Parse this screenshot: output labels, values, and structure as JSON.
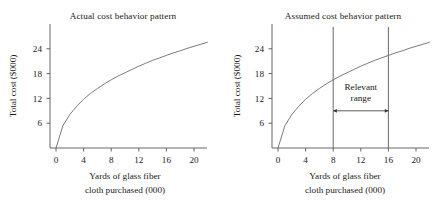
{
  "figure": {
    "background": "#ffffff",
    "ink": "#1a1a1a",
    "axis_color": "#555555",
    "curve_color": "#6b6b6b"
  },
  "chart_data": [
    {
      "type": "line",
      "panel": "left",
      "title": "Actual cost behavior pattern",
      "xlabel_line1": "Yards of glass fiber",
      "xlabel_line2": "cloth purchased (000)",
      "ylabel": "Total cost ($000)",
      "xlim": [
        0,
        22
      ],
      "ylim": [
        0,
        30
      ],
      "xticks": [
        0,
        4,
        8,
        12,
        16,
        20
      ],
      "xticklabels": [
        "0",
        "4",
        "8",
        "12",
        "16",
        "20"
      ],
      "yticks": [
        6,
        12,
        18,
        24
      ],
      "yticklabels": [
        "6",
        "12",
        "18",
        "24"
      ],
      "grid": false,
      "legend": "none",
      "series": [
        {
          "name": "Actual cost curve",
          "shape": "concave-increasing",
          "x": [
            0,
            1,
            2,
            3,
            4,
            5,
            6,
            7,
            8,
            9,
            10,
            11,
            12,
            13,
            14,
            15,
            16,
            17,
            18,
            19,
            20,
            21,
            22
          ],
          "y": [
            0.0,
            5.4,
            8.1,
            10.1,
            11.8,
            13.2,
            14.4,
            15.5,
            16.5,
            17.4,
            18.2,
            19.0,
            19.8,
            20.5,
            21.2,
            21.8,
            22.4,
            23.0,
            23.5,
            24.1,
            24.6,
            25.1,
            25.6
          ]
        }
      ],
      "annotations": []
    },
    {
      "type": "line",
      "panel": "right",
      "title": "Assumed cost behavior pattern",
      "xlabel_line1": "Yards of glass fiber",
      "xlabel_line2": "cloth purchased (000)",
      "ylabel": "Total cost ($000)",
      "xlim": [
        0,
        22
      ],
      "ylim": [
        0,
        30
      ],
      "xticks": [
        0,
        4,
        8,
        12,
        16,
        20
      ],
      "xticklabels": [
        "0",
        "4",
        "8",
        "12",
        "16",
        "20"
      ],
      "yticks": [
        6,
        12,
        18,
        24
      ],
      "yticklabels": [
        "6",
        "12",
        "18",
        "24"
      ],
      "grid": false,
      "legend": "none",
      "series": [
        {
          "name": "Assumed cost curve",
          "shape": "concave-increasing",
          "x": [
            0,
            1,
            2,
            3,
            4,
            5,
            6,
            7,
            8,
            9,
            10,
            11,
            12,
            13,
            14,
            15,
            16,
            17,
            18,
            19,
            20,
            21,
            22
          ],
          "y": [
            0.0,
            5.4,
            8.1,
            10.1,
            11.8,
            13.2,
            14.4,
            15.5,
            16.5,
            17.4,
            18.2,
            19.0,
            19.8,
            20.5,
            21.2,
            21.8,
            22.4,
            23.0,
            23.5,
            24.1,
            24.6,
            25.1,
            25.6
          ]
        }
      ],
      "annotations": [
        {
          "kind": "vline",
          "name": "relevant-range-lower-bound",
          "x": 8
        },
        {
          "kind": "vline",
          "name": "relevant-range-upper-bound",
          "x": 16
        },
        {
          "kind": "arrow",
          "name": "relevant-range-arrow",
          "x_from": 8,
          "x_to": 16,
          "y": 9.0,
          "double_headed": true
        },
        {
          "kind": "text",
          "name": "relevant-range-label",
          "line1": "Relevant",
          "line2": "range",
          "x": 12,
          "y": 14.0
        }
      ]
    }
  ]
}
